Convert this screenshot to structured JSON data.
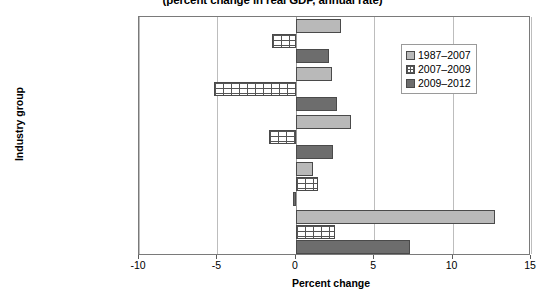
{
  "chart_data": {
    "type": "bar",
    "orientation": "horizontal",
    "title": "(percent change in real GDP, annual rate)",
    "xlabel": "Percent change",
    "ylabel": "Industry group",
    "xlim": [
      -10,
      15
    ],
    "xticks": [
      -10,
      -5,
      0,
      5,
      10,
      15
    ],
    "xtick_labels": [
      "-10",
      "-5",
      "0",
      "5",
      "10",
      "15"
    ],
    "grid": true,
    "legend_position": "upper right",
    "categories": [
      "Total",
      "Private goods-\nproducing",
      "Private services-\nproducing",
      "Government",
      "High-tech industries"
    ],
    "series": [
      {
        "name": "1987–2007",
        "color": "#b9b9b9",
        "values": [
          2.9,
          2.3,
          3.5,
          1.1,
          12.7
        ]
      },
      {
        "name": "2007–2009",
        "color": "#ffffff",
        "values": [
          -1.5,
          -5.2,
          -1.7,
          1.4,
          2.5
        ]
      },
      {
        "name": "2009–2012",
        "color": "#6d6d6d",
        "values": [
          2.1,
          2.6,
          2.4,
          -0.2,
          7.3
        ]
      }
    ]
  }
}
